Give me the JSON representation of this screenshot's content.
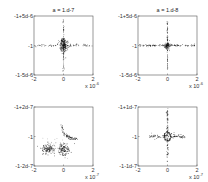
{
  "chart_data": [
    {
      "type": "scatter",
      "title": "a = 1.d-7",
      "xlabel": "",
      "ylabel": "",
      "x_ticks": [
        "-2",
        "0",
        "2"
      ],
      "x_exponent_label": "x 10",
      "x_exponent": "-6",
      "xlim": [
        -2,
        2
      ],
      "y_ticks": [
        "-1+5d-6",
        "-1",
        "-1-5d-6"
      ],
      "ylim": [
        -1,
        1
      ],
      "grid": false,
      "pattern": "cross",
      "description": "dense cross-shaped cloud centered at origin with dashed horizontal and vertical arms",
      "series": [
        {
          "name": "core",
          "shape": "blob",
          "center": [
            0,
            0
          ],
          "spread": [
            0.12,
            0.12
          ],
          "count": 220
        },
        {
          "name": "horizontal-arm",
          "shape": "line",
          "from": [
            -2,
            0
          ],
          "to": [
            2,
            0
          ],
          "jitter": 0.02,
          "count": 70
        },
        {
          "name": "vertical-arm",
          "shape": "line",
          "from": [
            0,
            -0.9
          ],
          "to": [
            0,
            0.9
          ],
          "jitter": 0.02,
          "count": 60
        }
      ]
    },
    {
      "type": "scatter",
      "title": "a = 1.d-8",
      "xlabel": "",
      "ylabel": "",
      "x_ticks": [
        "-2",
        "0",
        "2"
      ],
      "x_exponent_label": "x 10",
      "x_exponent": "-6",
      "xlim": [
        -2,
        2
      ],
      "y_ticks": [
        "-1+5d-6",
        "-1",
        "-1-5d-6"
      ],
      "ylim": [
        -1,
        1
      ],
      "grid": false,
      "pattern": "cross",
      "description": "thin cross centered at origin, horizontal arm heavier than vertical",
      "series": [
        {
          "name": "core",
          "shape": "blob",
          "center": [
            0,
            0
          ],
          "spread": [
            0.1,
            0.05
          ],
          "count": 90
        },
        {
          "name": "horizontal-arm",
          "shape": "line",
          "from": [
            -1.9,
            0
          ],
          "to": [
            1.9,
            0
          ],
          "jitter": 0.015,
          "count": 110
        },
        {
          "name": "vertical-arm",
          "shape": "line",
          "from": [
            0,
            -0.8
          ],
          "to": [
            0,
            0.8
          ],
          "jitter": 0.015,
          "count": 70
        }
      ]
    },
    {
      "type": "scatter",
      "title": "",
      "xlabel": "",
      "ylabel": "",
      "x_ticks": [
        "-2",
        "0",
        "2"
      ],
      "x_exponent_label": "x 10",
      "x_exponent": "-7",
      "xlim": [
        -2,
        2
      ],
      "y_ticks": [
        "-1+2d-7",
        "-1",
        "-1-2d-7"
      ],
      "ylim": [
        -1,
        1
      ],
      "grid": false,
      "pattern": "clusters",
      "description": "two dense clusters in lower half and a curved arc rising from center-right",
      "series": [
        {
          "name": "left-cluster",
          "shape": "blob",
          "center": [
            -1.05,
            -0.42
          ],
          "spread": [
            0.22,
            0.09
          ],
          "count": 120
        },
        {
          "name": "center-cluster",
          "shape": "blob",
          "center": [
            0.05,
            -0.45
          ],
          "spread": [
            0.2,
            0.1
          ],
          "count": 130
        },
        {
          "name": "arc",
          "shape": "arc",
          "points": [
            [
              -0.1,
              0.35
            ],
            [
              0.0,
              0.12
            ],
            [
              0.25,
              0.0
            ],
            [
              0.55,
              -0.06
            ],
            [
              0.9,
              -0.09
            ]
          ],
          "jitter": 0.03,
          "count": 80
        },
        {
          "name": "faint-scatter",
          "shape": "blob",
          "center": [
            -0.6,
            -0.3
          ],
          "spread": [
            0.4,
            0.15
          ],
          "count": 40
        }
      ]
    },
    {
      "type": "scatter",
      "title": "",
      "xlabel": "",
      "ylabel": "",
      "x_ticks": [
        "-2",
        "0",
        "2"
      ],
      "x_exponent_label": "x 10",
      "x_exponent": "-7",
      "xlim": [
        -2,
        2
      ],
      "y_ticks": [
        "-1+1d-7",
        "-1",
        "-1-1d-7"
      ],
      "ylim": [
        -1,
        1
      ],
      "grid": false,
      "pattern": "star",
      "description": "star/cross pattern centered at origin with a small loop around the center and dashed arms",
      "series": [
        {
          "name": "loop",
          "shape": "ring",
          "center": [
            0,
            0
          ],
          "radius": [
            0.2,
            0.15
          ],
          "count": 80
        },
        {
          "name": "horizontal-arm",
          "shape": "line",
          "from": [
            -1.2,
            0
          ],
          "to": [
            1.2,
            0
          ],
          "jitter": 0.04,
          "count": 110
        },
        {
          "name": "vertical-arm",
          "shape": "line",
          "from": [
            0,
            -0.85
          ],
          "to": [
            0,
            0.95
          ],
          "jitter": 0.03,
          "count": 90
        }
      ]
    }
  ]
}
